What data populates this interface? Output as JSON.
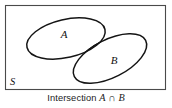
{
  "diagram": {
    "type": "venn",
    "universe": {
      "label": "S",
      "shape": "rectangle"
    },
    "sets": [
      {
        "id": "A",
        "label": "A",
        "shape": "ellipse"
      },
      {
        "id": "B",
        "label": "B",
        "shape": "ellipse"
      }
    ],
    "shaded_region": {
      "name": "intersection",
      "operands": [
        "A",
        "B"
      ],
      "fill_color": "#dcdcdc"
    },
    "colors": {
      "background": "#ffffff",
      "outline": "#141414",
      "frame": "#4a4a4a",
      "shading": "#dcdcdc",
      "text": "#111111"
    }
  },
  "caption": {
    "word": "Intersection",
    "left_operand": "A",
    "operator": "∩",
    "right_operand": "B"
  }
}
